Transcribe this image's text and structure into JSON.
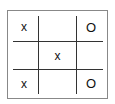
{
  "game": "tic-tac-toe",
  "board": [
    [
      "x",
      "",
      "O"
    ],
    [
      "",
      "x",
      ""
    ],
    [
      "x",
      "",
      "O"
    ]
  ],
  "colors": {
    "grid": "#333333",
    "border": "#888888",
    "mark": "#111111",
    "background": "#ffffff"
  }
}
